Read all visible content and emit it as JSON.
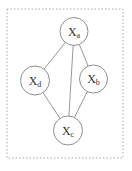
{
  "canvas": {
    "width": 132,
    "height": 171
  },
  "frame": {
    "x": 7,
    "y": 9,
    "width": 116,
    "height": 149
  },
  "colors": {
    "background": "#ffffff",
    "frame_stroke": "#aaaaaa",
    "edge_stroke": "#999999",
    "node_stroke": "#8f8f8f",
    "node_fill": "#ffffff",
    "label_color": "#333333"
  },
  "chart_data": {
    "type": "graph-diagram",
    "title": "",
    "nodes": [
      {
        "id": "Xa",
        "label": "X",
        "subscript": "a",
        "x": 74,
        "y": 31.5,
        "r": 14
      },
      {
        "id": "Xd",
        "label": "X",
        "subscript": "d",
        "x": 35,
        "y": 80.5,
        "r": 14.5
      },
      {
        "id": "Xb",
        "label": "X",
        "subscript": "b",
        "x": 93.5,
        "y": 79,
        "r": 14
      },
      {
        "id": "Xc",
        "label": "X",
        "subscript": "c",
        "x": 68,
        "y": 130.5,
        "r": 14.5
      }
    ],
    "edges": [
      [
        "Xa",
        "Xd"
      ],
      [
        "Xa",
        "Xb"
      ],
      [
        "Xa",
        "Xc"
      ],
      [
        "Xd",
        "Xc"
      ],
      [
        "Xb",
        "Xc"
      ]
    ]
  },
  "label_font_size": 12,
  "subscript_font_size": 8
}
